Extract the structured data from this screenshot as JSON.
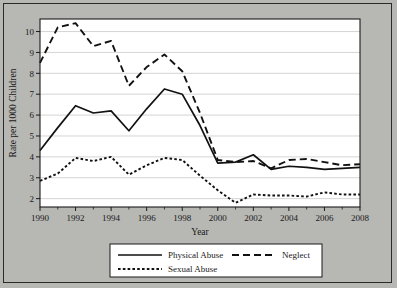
{
  "chart_data": {
    "type": "line",
    "title": "",
    "xlabel": "Year",
    "ylabel": "Rate per 1000 Children",
    "xlim": [
      1990,
      2008
    ],
    "ylim": [
      1.6,
      10.6
    ],
    "grid": true,
    "grid_axis": "y",
    "legend_position": "bottom",
    "xticks": [
      1990,
      1992,
      1994,
      1996,
      1998,
      2000,
      2002,
      2004,
      2006,
      2008
    ],
    "xtick_labels": [
      "1990",
      "1992",
      "1994",
      "1996",
      "1998",
      "2000",
      "2002",
      "2004",
      "2006",
      "2008"
    ],
    "yticks": [
      2,
      3,
      4,
      5,
      6,
      7,
      8,
      9,
      10
    ],
    "ytick_labels": [
      "2",
      "3",
      "4",
      "5",
      "6",
      "7",
      "8",
      "9",
      "10"
    ],
    "x": [
      1990,
      1991,
      1992,
      1993,
      1994,
      1995,
      1996,
      1997,
      1998,
      1999,
      2000,
      2001,
      2002,
      2003,
      2004,
      2005,
      2006,
      2007,
      2008
    ],
    "series": [
      {
        "name": "Physical Abuse",
        "style": "solid",
        "color": "#111111",
        "values": [
          4.3,
          5.4,
          6.45,
          6.1,
          6.2,
          5.25,
          6.3,
          7.25,
          7.0,
          5.5,
          3.7,
          3.75,
          4.1,
          3.4,
          3.55,
          3.5,
          3.4,
          3.45,
          3.5
        ]
      },
      {
        "name": "Neglect",
        "style": "dashed",
        "color": "#111111",
        "values": [
          8.5,
          10.2,
          10.4,
          9.3,
          9.55,
          7.4,
          8.3,
          8.9,
          8.1,
          6.1,
          3.85,
          3.75,
          3.8,
          3.45,
          3.85,
          3.9,
          3.75,
          3.6,
          3.65
        ]
      },
      {
        "name": "Sexual Abuse",
        "style": "dotted",
        "color": "#111111",
        "values": [
          2.85,
          3.2,
          3.95,
          3.8,
          4.0,
          3.15,
          3.6,
          3.95,
          3.85,
          3.1,
          2.4,
          1.8,
          2.2,
          2.15,
          2.15,
          2.1,
          2.3,
          2.2,
          2.2
        ]
      }
    ],
    "legend_entries": [
      {
        "label": "Physical Abuse",
        "style": "solid"
      },
      {
        "label": "Neglect",
        "style": "dashed"
      },
      {
        "label": "Sexual Abuse",
        "style": "dotted"
      }
    ]
  }
}
